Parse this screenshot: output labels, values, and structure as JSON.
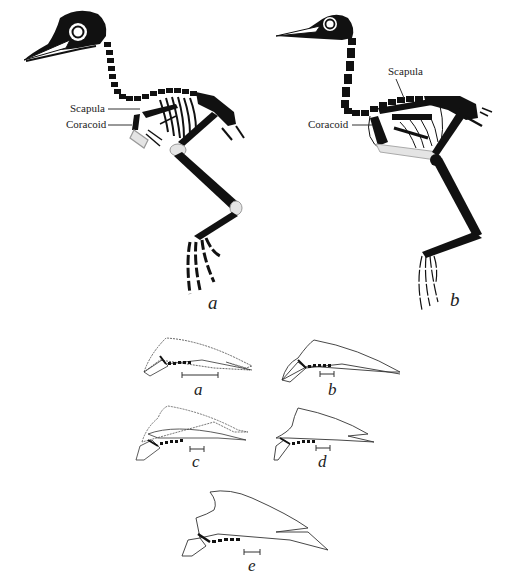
{
  "figure": {
    "type": "anatomical-diagram",
    "ink_color": "#111111",
    "fill_light": "#d8d8d8",
    "background": "#ffffff"
  },
  "skeletons": [
    {
      "id": "a",
      "caption": "a",
      "labels": [
        {
          "text": "Scapula"
        },
        {
          "text": "Coracoid"
        }
      ]
    },
    {
      "id": "b",
      "caption": "b",
      "labels": [
        {
          "text": "Scapula"
        },
        {
          "text": "Coracoid"
        }
      ]
    }
  ],
  "shoulder_girdles": [
    {
      "id": "a",
      "caption": "a"
    },
    {
      "id": "b",
      "caption": "b"
    },
    {
      "id": "c",
      "caption": "c"
    },
    {
      "id": "d",
      "caption": "d"
    },
    {
      "id": "e",
      "caption": "e"
    }
  ]
}
